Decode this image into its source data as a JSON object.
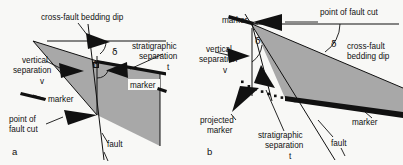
{
  "figure": {
    "background_color": "#f8f8f6",
    "gray_fill_color": "#a8a8a8",
    "line_color": "#111111",
    "delta_symbol": "δ"
  },
  "panels": [
    {
      "id": "a",
      "label": "a",
      "annotations": [
        {
          "name": "cross-fault-bedding-dip",
          "text": "cross-fault bedding dip"
        },
        {
          "name": "stratigraphic-separation",
          "text_line1": "stratigraphic",
          "text_line2": "separation",
          "symbol": "t"
        },
        {
          "name": "vertical-separation",
          "text_line1": "vertical",
          "text_line2": "separation",
          "symbol": "v"
        },
        {
          "name": "marker-upper",
          "text": "marker"
        },
        {
          "name": "marker-lower",
          "text": "marker"
        },
        {
          "name": "point-of-fault-cut",
          "text_line1": "point of",
          "text_line2": "fault cut"
        },
        {
          "name": "fault",
          "text": "fault"
        },
        {
          "name": "dip-angle-upper",
          "text": "δ"
        },
        {
          "name": "dip-angle-lower",
          "text": "δ"
        }
      ]
    },
    {
      "id": "b",
      "label": "b",
      "annotations": [
        {
          "name": "point-of-fault-cut",
          "text": "point of fault cut"
        },
        {
          "name": "marker-upper",
          "text": "marker"
        },
        {
          "name": "cross-fault-bedding-dip",
          "text_line1": "cross-fault",
          "text_line2": "bedding dip"
        },
        {
          "name": "vertical-separation",
          "text_line1": "vertical",
          "text_line2": "separation",
          "symbol": "v"
        },
        {
          "name": "projected-marker",
          "text_line1": "projected",
          "text_line2": "marker"
        },
        {
          "name": "stratigraphic-separation",
          "text_line1": "stratigraphic",
          "text_line2": "separation",
          "symbol": "t"
        },
        {
          "name": "marker-lower",
          "text": "marker"
        },
        {
          "name": "fault",
          "text": "fault"
        },
        {
          "name": "dip-angle-upper",
          "text": "δ"
        },
        {
          "name": "dip-angle-lower",
          "text": "δ"
        }
      ]
    }
  ]
}
